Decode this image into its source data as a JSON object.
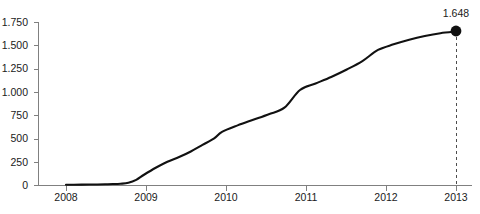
{
  "chart_data": {
    "type": "line",
    "title": "",
    "subtitle": "",
    "xlabel": "",
    "ylabel": "",
    "grid": false,
    "legend": false,
    "x_tick_labels": [
      "2008",
      "2009",
      "2010",
      "2011",
      "2012",
      "2013"
    ],
    "y_tick_labels": [
      "1.750",
      "1.500",
      "1.250",
      "1.000",
      "750",
      "500",
      "250",
      "0"
    ],
    "y_tick_values": [
      1750,
      1500,
      1250,
      1000,
      750,
      500,
      250,
      0
    ],
    "ylim": [
      0,
      1750
    ],
    "xlim": [
      2008,
      2013
    ],
    "number_format": "european-thousands-separator-dot",
    "series": [
      {
        "name": "cumulative",
        "x": [
          2008.0,
          2008.1,
          2008.2,
          2008.3,
          2008.4,
          2008.5,
          2008.6,
          2008.7,
          2008.8,
          2008.9,
          2009.0,
          2009.15,
          2009.3,
          2009.45,
          2009.6,
          2009.75,
          2009.9,
          2010.0,
          2010.2,
          2010.4,
          2010.6,
          2010.8,
          2011.0,
          2011.2,
          2011.4,
          2011.6,
          2011.8,
          2012.0,
          2012.2,
          2012.4,
          2012.6,
          2012.8,
          2013.0
        ],
        "values": [
          2,
          3,
          4,
          5,
          6,
          8,
          10,
          14,
          24,
          55,
          110,
          185,
          250,
          300,
          360,
          430,
          500,
          570,
          640,
          700,
          760,
          830,
          1020,
          1090,
          1160,
          1240,
          1330,
          1450,
          1510,
          1560,
          1600,
          1630,
          1648
        ]
      }
    ],
    "annotations": [
      {
        "name": "endpoint-value",
        "label": "1.648",
        "x": 2013,
        "y": 1648,
        "marker": "filled-circle",
        "leader_line": "dashed-vertical"
      }
    ],
    "colors": {
      "series_line": "#111111",
      "marker": "#111111",
      "axis": "#808080",
      "text": "#1a1a1a",
      "leader": "#4d4d4d",
      "background": "#ffffff"
    },
    "geometry": {
      "plot_left": 38,
      "plot_right": 472,
      "plot_top": 22,
      "plot_bottom": 185,
      "x_tick_px": [
        66,
        146,
        226,
        306,
        386,
        456
      ],
      "y_tick_px": [
        22,
        45.3,
        68.6,
        91.9,
        115.2,
        138.5,
        161.8,
        185
      ],
      "marker_px": {
        "x": 456,
        "y": 31
      },
      "label_px": {
        "x": 456,
        "y": 13
      }
    }
  }
}
